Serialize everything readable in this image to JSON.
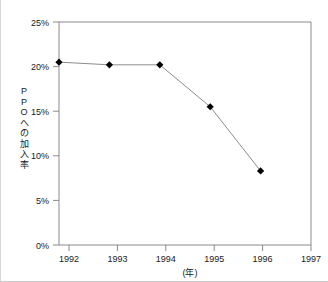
{
  "chart_data": {
    "type": "line",
    "title": "",
    "xlabel": "(年)",
    "ylabel": "PPOへの加入率",
    "ylabel_chars": [
      "P",
      "P",
      "O",
      "へ",
      "の",
      "加",
      "入",
      "率"
    ],
    "x": [
      1992,
      1993,
      1994,
      1995,
      1996
    ],
    "values": [
      20.5,
      20.2,
      20.2,
      15.5,
      8.3
    ],
    "series": [
      {
        "name": "PPOへの加入率",
        "values": [
          20.5,
          20.2,
          20.2,
          15.5,
          8.3
        ]
      }
    ],
    "xtick_labels": [
      "1992",
      "1993",
      "1994",
      "1995",
      "1996",
      "1997"
    ],
    "xtick_values": [
      1992,
      1993,
      1994,
      1995,
      1996,
      1997
    ],
    "ytick_labels": [
      "0%",
      "5%",
      "10%",
      "15%",
      "20%",
      "25%"
    ],
    "ytick_values": [
      0,
      5,
      10,
      15,
      20,
      25
    ],
    "xlim": [
      1992,
      1997
    ],
    "ylim": [
      0,
      25
    ],
    "grid": false,
    "legend": false,
    "marker": "diamond",
    "marker_color": "#000000",
    "line_color": "#8c8c8c",
    "axis_color": "#8a8a8a",
    "text_color": "#1a1a1a",
    "background": "#ffffff"
  }
}
